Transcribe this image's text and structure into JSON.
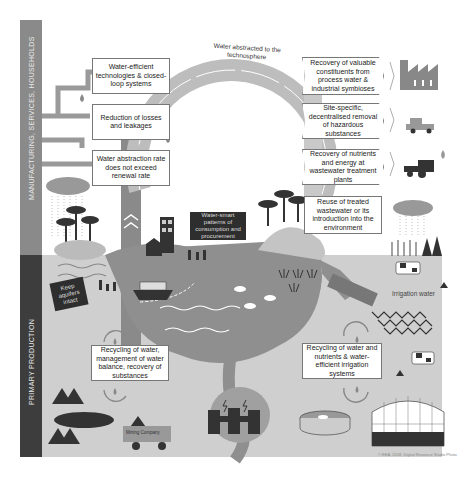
{
  "diagram": {
    "side_labels": {
      "top": "MANUFACTURING, SERVICES, HOUSEHOLDS",
      "bottom": "PRIMARY PRODUCTION"
    },
    "arc_label": "Water abstracted to the technosphere",
    "left_boxes": [
      "Water-efficient technologies & closed-loop systems",
      "Reduction of losses and leakages",
      "Water abstraction rate does not exceed renewal rate"
    ],
    "right_boxes": [
      "Recovery of valuable constituents from process water & industrial symbioses",
      "Site-specific, decentralised removal of hazardous substances",
      "Recovery of nutrients and energy at wastewater treatment plants",
      "Reuse of treated wastewater or its introduction into the environment"
    ],
    "center_sign": "Water-smart patterns of consumption and procurement",
    "aquifer_sign": "Keep aquifers intact",
    "bottom_left_box": "Recycling of water, management of water balance, recovery of substances",
    "bottom_right_box": "Recycling of water and nutrients & water-efficient irrigation systems",
    "irrigation_label": "Irrigation water",
    "truck_label": "Mining Company",
    "copyright": "© EEA, 2018, Digital Resource Studio Photo",
    "icons": [
      "factory-icon",
      "truck-icon",
      "tractor-icon",
      "cloud-rain-icon",
      "tree-icon",
      "house-icon",
      "ship-icon",
      "fish-icon",
      "cow-icon",
      "greenhouse-icon",
      "power-plant-icon",
      "water-tank-icon",
      "mountain-icon",
      "recycle-arrows-icon",
      "water-drop-icon",
      "pipe-icon"
    ],
    "colors": {
      "band_top": "#8a8a8a",
      "band_bottom": "#3d3d3d",
      "ground": "#cfcfcf",
      "water": "#8f8f8f",
      "arc": "#b5b5b5",
      "dark": "#2e2e2e"
    }
  }
}
